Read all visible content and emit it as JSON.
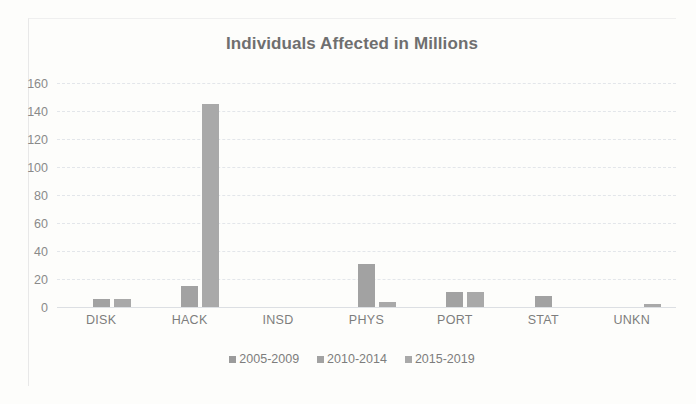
{
  "chart_data": {
    "type": "bar",
    "title": "Individuals Affected in Millions",
    "xlabel": "",
    "ylabel": "",
    "ylim": [
      0,
      160
    ],
    "ytick_step": 20,
    "yticks": [
      160,
      140,
      120,
      100,
      80,
      60,
      40,
      20,
      0
    ],
    "grid": true,
    "legend_position": "bottom",
    "categories": [
      "DISK",
      "HACK",
      "INSD",
      "PHYS",
      "PORT",
      "STAT",
      "UNKN"
    ],
    "series": [
      {
        "name": "2005-2009",
        "values": [
          0,
          0,
          0,
          0,
          0,
          0,
          0
        ],
        "color": "#9b9b9b"
      },
      {
        "name": "2010-2014",
        "values": [
          6,
          15,
          0,
          31,
          10.5,
          8,
          0
        ],
        "color": "#a2a2a2"
      },
      {
        "name": "2015-2019",
        "values": [
          5.5,
          145,
          0,
          3.5,
          11,
          0,
          2.5
        ],
        "color": "#a9a9a9"
      }
    ]
  },
  "legend": {
    "items": [
      {
        "label": "2005-2009"
      },
      {
        "label": "2010-2014"
      },
      {
        "label": "2015-2019"
      }
    ]
  }
}
